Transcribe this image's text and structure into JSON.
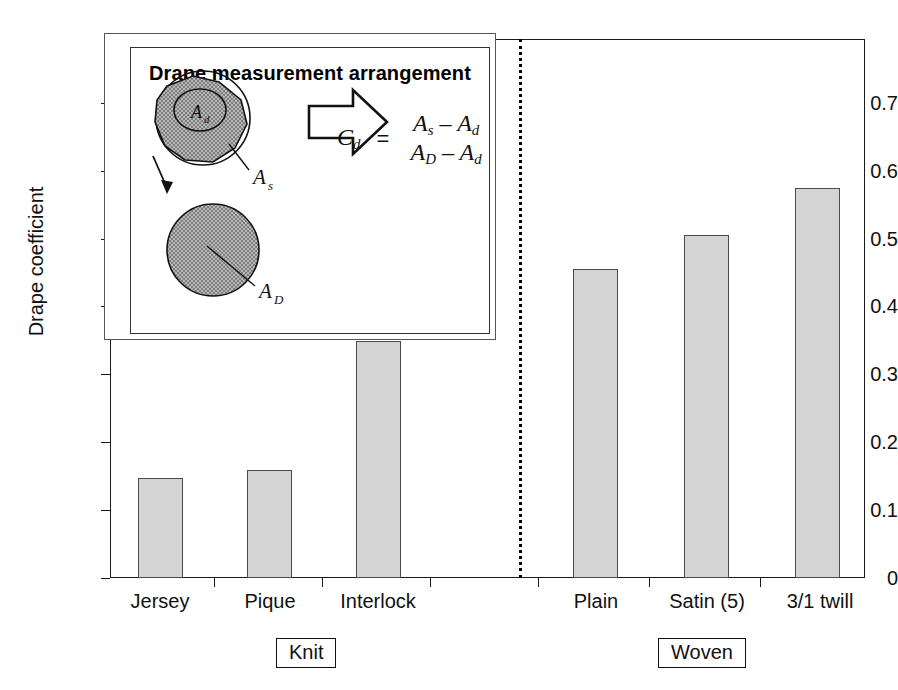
{
  "chart_data": {
    "type": "bar",
    "title": "",
    "xlabel": "",
    "ylabel": "Drape coefficient",
    "ylim": [
      0,
      0.92
    ],
    "grid": false,
    "legend": "none",
    "categories": [
      "Jersey",
      "Pique",
      "Interlock",
      "Plain",
      "Satin (5)",
      "3/1 twill"
    ],
    "values": [
      0.171,
      0.185,
      0.404,
      0.528,
      0.586,
      0.665
    ],
    "ytick_labels": [
      "0",
      "0.1",
      "0.2",
      "0.3",
      "0.4",
      "0.5",
      "0.6",
      "0.7"
    ],
    "ytick_values": [
      0,
      0.1,
      0.2,
      0.3,
      0.4,
      0.5,
      0.6,
      0.7
    ],
    "groups": [
      {
        "label": "Knit",
        "categories": [
          "Jersey",
          "Pique",
          "Interlock"
        ]
      },
      {
        "label": "Woven",
        "categories": [
          "Plain",
          "Satin (5)",
          "3/1 twill"
        ]
      }
    ],
    "bar_fill_color": "#d4d4d4",
    "bar_edge_color": "#4a4a4a",
    "divider": "dotted vertical separator between Knit and Woven groups"
  },
  "inset": {
    "title": "Drape measurement arrangement",
    "formula": {
      "lhs": "C",
      "lhs_sub": "d",
      "equals": "=",
      "numerator_first": "A",
      "numerator_first_sub": "s",
      "numerator_minus": "–",
      "numerator_second": "A",
      "numerator_second_sub": "d",
      "denominator_first": "A",
      "denominator_first_sub": "D",
      "denominator_minus": "–",
      "denominator_second": "A",
      "denominator_second_sub": "d"
    },
    "diagram_labels": {
      "inner_disc": "A",
      "inner_disc_sub": "d",
      "draped_shadow": "A",
      "draped_shadow_sub": "s",
      "flat_specimen": "A",
      "flat_specimen_sub": "D"
    }
  }
}
